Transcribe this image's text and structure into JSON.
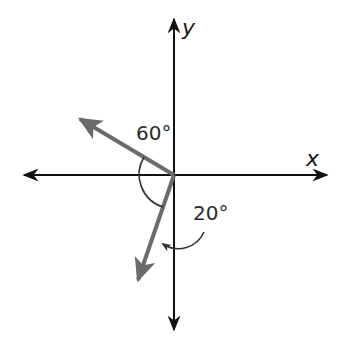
{
  "diagram": {
    "axes": {
      "x_label": "x",
      "y_label": "y"
    },
    "vectors": [
      {
        "name": "vector-upper-left",
        "color": "#6b6b6b"
      },
      {
        "name": "vector-lower-left",
        "color": "#6b6b6b"
      }
    ],
    "angles": [
      {
        "label": "60°",
        "description": "angle between upper-left vector and negative x-axis region"
      },
      {
        "label": "20°",
        "description": "angle between lower vector and negative y-axis with rotation arrow"
      }
    ],
    "colors": {
      "axis": "#111111",
      "vector": "#6b6b6b",
      "arc": "#333333",
      "background": "#ffffff"
    }
  }
}
